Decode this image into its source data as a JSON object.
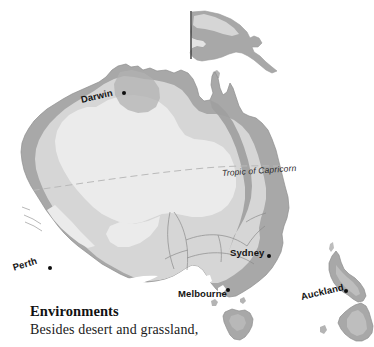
{
  "map": {
    "region_title": "Australia and New Zealand",
    "colors": {
      "ocean": "#ffffff",
      "desert_interior": "#ebebeb",
      "grassland_band": "#d6d6d6",
      "vegetated_coast": "#a8a8a8",
      "outline": "#8e8e8e",
      "border_line": "#6e6e6e",
      "label_text": "#141414",
      "tropic_line": "#b9b9b9"
    },
    "reference_lines": [
      {
        "name": "tropic-of-capricorn",
        "label": "Tropic of Capricorn",
        "style": "dashed"
      }
    ],
    "cities": [
      {
        "name": "darwin",
        "label": "Darwin",
        "label_x": 81,
        "label_y": 95,
        "rotation": -13,
        "dot_x": 122,
        "dot_y": 93
      },
      {
        "name": "perth",
        "label": "Perth",
        "label_x": 13,
        "label_y": 263,
        "rotation": -17,
        "dot_x": 48,
        "dot_y": 268
      },
      {
        "name": "sydney",
        "label": "Sydney",
        "label_x": 230,
        "label_y": 248,
        "rotation": 0,
        "dot_x": 267,
        "dot_y": 254
      },
      {
        "name": "melbourne",
        "label": "Melbourne",
        "label_x": 178,
        "label_y": 289,
        "rotation": 0,
        "dot_x": 226,
        "dot_y": 289
      },
      {
        "name": "auckland",
        "label": "Auckland",
        "label_x": 301,
        "label_y": 292,
        "rotation": -13,
        "dot_x": 344,
        "dot_y": 291
      }
    ],
    "landmasses": [
      "papua-new-guinea",
      "australia-mainland",
      "tasmania",
      "new-zealand-north-island",
      "new-zealand-south-island"
    ]
  },
  "caption": {
    "heading": "Environments",
    "body": "Besides desert and grassland,"
  }
}
